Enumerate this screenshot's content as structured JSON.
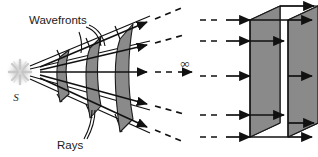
{
  "figure": {
    "background_color": "#ffffff",
    "stroke_color": "#111111",
    "wavefront_fill": "#8a8a8a",
    "wavefront_stroke": "#1a1a1a",
    "source_glow_color": "#d9d9d9"
  },
  "labels": {
    "wavefronts": "Wavefronts",
    "rays": "Rays",
    "source": "S",
    "infinity": "∞"
  },
  "left_panel": {
    "name": "spherical-wavefronts-cone",
    "source_point": {
      "x": 40,
      "y": 72
    },
    "ray_count": 5,
    "rays": [
      {
        "id": "ray-1",
        "end_x": 152,
        "end_y": 20,
        "dash_end_x": 182,
        "dash_end_y": 6
      },
      {
        "id": "ray-2",
        "end_x": 152,
        "end_y": 45,
        "dash_end_x": 182,
        "dash_end_y": 34
      },
      {
        "id": "ray-3",
        "end_x": 152,
        "end_y": 72,
        "dash_end_x": 182,
        "dash_end_y": 72
      },
      {
        "id": "ray-4",
        "end_x": 152,
        "end_y": 105,
        "dash_end_x": 182,
        "dash_end_y": 114
      },
      {
        "id": "ray-5",
        "end_x": 152,
        "end_y": 128,
        "dash_end_x": 182,
        "dash_end_y": 142
      }
    ],
    "wavefront_arcs": [
      {
        "id": "wavefront-1",
        "center_x": 68,
        "half_height": 22
      },
      {
        "id": "wavefront-2",
        "center_x": 98,
        "half_height": 38
      },
      {
        "id": "wavefront-3",
        "center_x": 128,
        "half_height": 54
      }
    ]
  },
  "right_panel": {
    "name": "plane-wavefronts-box",
    "plane_count": 2,
    "incoming_ray_count": 5,
    "outgoing_ray_count": 5,
    "box": {
      "left": 250,
      "right": 288,
      "top": 20,
      "bottom": 137,
      "depth_x": 30,
      "depth_y": -14
    }
  }
}
